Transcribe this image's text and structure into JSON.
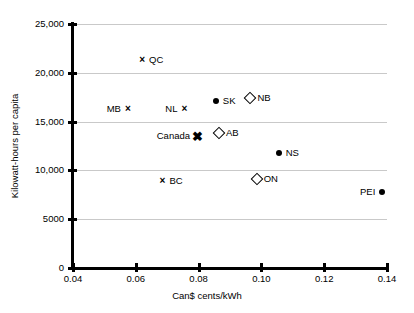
{
  "chart_data": {
    "type": "scatter",
    "title": "",
    "xlabel": "Can$ cents/kWh",
    "ylabel": "Kilowatt-hours per capita",
    "xlim": [
      0.04,
      0.14
    ],
    "ylim": [
      0,
      25000
    ],
    "xticks": [
      "0.04",
      "0.06",
      "0.08",
      "0.10",
      "0.12",
      "0.14"
    ],
    "xtick_values": [
      0.04,
      0.06,
      0.08,
      0.1,
      0.12,
      0.14
    ],
    "yticks": [
      "0",
      "5000",
      "10,000",
      "15,000",
      "20,000",
      "25,000"
    ],
    "ytick_values": [
      0,
      5000,
      10000,
      15000,
      20000,
      25000
    ],
    "grid": "horizontal",
    "legend": "none",
    "points": [
      {
        "label": "QC",
        "x": 0.062,
        "y": 21300,
        "marker": "cross",
        "label_side": "right"
      },
      {
        "label": "MB",
        "x": 0.0575,
        "y": 16300,
        "marker": "cross",
        "label_side": "left"
      },
      {
        "label": "NL",
        "x": 0.0755,
        "y": 16300,
        "marker": "cross",
        "label_side": "left"
      },
      {
        "label": "SK",
        "x": 0.0855,
        "y": 17100,
        "marker": "dot",
        "label_side": "right"
      },
      {
        "label": "NB",
        "x": 0.0965,
        "y": 17400,
        "marker": "diamond",
        "label_side": "right"
      },
      {
        "label": "Canada",
        "x": 0.0795,
        "y": 13500,
        "marker": "cross-bold",
        "label_side": "left"
      },
      {
        "label": "AB",
        "x": 0.0865,
        "y": 13800,
        "marker": "diamond",
        "label_side": "right"
      },
      {
        "label": "NS",
        "x": 0.1055,
        "y": 11800,
        "marker": "dot",
        "label_side": "right"
      },
      {
        "label": "ON",
        "x": 0.0985,
        "y": 9100,
        "marker": "diamond",
        "label_side": "right"
      },
      {
        "label": "BC",
        "x": 0.0685,
        "y": 8900,
        "marker": "cross",
        "label_side": "right"
      },
      {
        "label": "PEI",
        "x": 0.1385,
        "y": 7800,
        "marker": "dot",
        "label_side": "left"
      }
    ],
    "colors": {
      "marker": "#000000",
      "axis": "#000000",
      "gridline": "#c9c9c9",
      "background": "#ffffff"
    }
  }
}
